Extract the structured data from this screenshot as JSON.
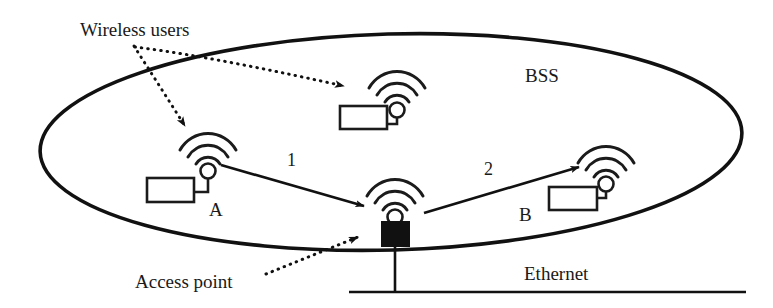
{
  "figure": {
    "type": "network-diagram",
    "annotations": {
      "wireless_users": "Wireless users",
      "access_point": "Access point"
    },
    "regions": {
      "bss": "BSS"
    },
    "networks": {
      "ethernet": "Ethernet"
    },
    "nodes": [
      {
        "id": "station-top",
        "label": "",
        "kind": "wireless-station"
      },
      {
        "id": "station-a",
        "label": "A",
        "kind": "wireless-station"
      },
      {
        "id": "station-b",
        "label": "B",
        "kind": "wireless-station"
      },
      {
        "id": "access-point",
        "label": "",
        "kind": "access-point"
      }
    ],
    "flows": [
      {
        "id": "flow-1",
        "label": "1",
        "from": "station-a",
        "to": "access-point"
      },
      {
        "id": "flow-2",
        "label": "2",
        "from": "access-point",
        "to": "station-b"
      }
    ],
    "colors": {
      "ink": "#111111",
      "background": "#ffffff"
    }
  }
}
